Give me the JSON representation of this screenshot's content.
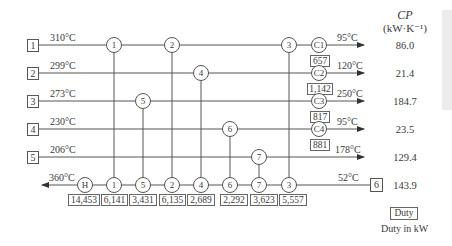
{
  "header": {
    "cp_title": "CP",
    "cp_unit": "(kW·K⁻¹)"
  },
  "streams": [
    {
      "id": "1",
      "inlet_temp": "310°C",
      "outlet_temp": "95°C",
      "cooler": "C1",
      "cooler_duty": "657",
      "cp": "86.0"
    },
    {
      "id": "2",
      "inlet_temp": "299°C",
      "outlet_temp": "120°C",
      "cooler": "C2",
      "cooler_duty": "1,142",
      "cp": "21.4"
    },
    {
      "id": "3",
      "inlet_temp": "273°C",
      "outlet_temp": "250°C",
      "cooler": "C3",
      "cooler_duty": "817",
      "cp": "184.7"
    },
    {
      "id": "4",
      "inlet_temp": "230°C",
      "outlet_temp": "95°C",
      "cooler": "C4",
      "cooler_duty": "881",
      "cp": "23.5"
    },
    {
      "id": "5",
      "inlet_temp": "206°C",
      "outlet_temp": "178°C",
      "cp": "129.4"
    }
  ],
  "cold_stream": {
    "id": "6",
    "inlet_temp": "52°C",
    "outlet_temp": "360°C",
    "cp": "143.9",
    "heater": "H",
    "heater_duty": "14,453"
  },
  "exchangers": [
    {
      "id": "1",
      "hot_stream": "1",
      "duty": "6,141"
    },
    {
      "id": "5",
      "hot_stream": "3",
      "duty": "3,431"
    },
    {
      "id": "2",
      "hot_stream": "1",
      "duty": "6,135"
    },
    {
      "id": "4",
      "hot_stream": "2",
      "duty": "2,689"
    },
    {
      "id": "6",
      "hot_stream": "4",
      "duty": "2,292"
    },
    {
      "id": "7",
      "hot_stream": "5",
      "duty": "3,623"
    },
    {
      "id": "3",
      "hot_stream": "1",
      "duty": "5,557"
    }
  ],
  "legend": {
    "duty_box": "Duty",
    "duty_caption": "Duty in kW"
  }
}
